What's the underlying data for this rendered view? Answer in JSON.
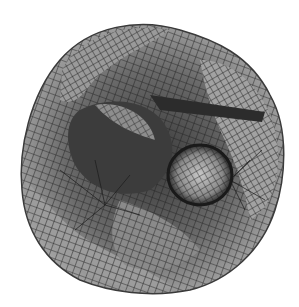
{
  "figure": {
    "background": "#ffffff",
    "colors": {
      "light_face": "#b4b4b4",
      "mid_face": "#8c8c8c",
      "dark_face": "#4a4a4a",
      "darkest": "#2a2a2a",
      "grid_line": "#1e1e1e"
    }
  }
}
